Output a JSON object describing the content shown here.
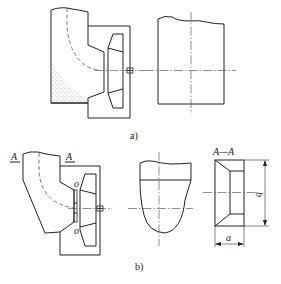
{
  "figure": {
    "subfigures": [
      {
        "id": "a",
        "caption": "a)",
        "views": [
          "side-section-with-casing-and-impeller",
          "front-view-rectangle"
        ]
      },
      {
        "id": "b",
        "caption": "b)",
        "views": [
          "side-section-with-casing-and-impeller",
          "front-view-rounded",
          "section-A-A"
        ],
        "section_marks": [
          "A",
          "A"
        ],
        "section_title": "A—A",
        "point_labels": [
          "o",
          "o"
        ],
        "dimensions": {
          "width": "a",
          "height": "b"
        }
      }
    ]
  },
  "colors": {
    "line": "#222222",
    "background": "#ffffff"
  }
}
